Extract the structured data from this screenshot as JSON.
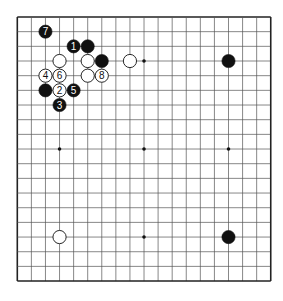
{
  "board": {
    "size": 19,
    "origin_x": 17.3,
    "origin_y": 17,
    "spacing_x": 14.08,
    "spacing_y": 14.67,
    "stone_radius": 6.6,
    "line_color": "#555555",
    "border_color": "#222222",
    "star_points": [
      [
        3,
        3
      ],
      [
        9,
        3
      ],
      [
        15,
        3
      ],
      [
        3,
        9
      ],
      [
        9,
        9
      ],
      [
        15,
        9
      ],
      [
        3,
        15
      ],
      [
        9,
        15
      ],
      [
        15,
        15
      ]
    ],
    "colors": {
      "black": "#111111",
      "white": "#ffffff",
      "black_label": "#ffffff",
      "white_label": "#111111"
    }
  },
  "stones": [
    {
      "color": "black",
      "col": 2,
      "row": 1,
      "label": "7"
    },
    {
      "color": "black",
      "col": 4,
      "row": 2,
      "label": "1"
    },
    {
      "color": "black",
      "col": 5,
      "row": 2,
      "label": ""
    },
    {
      "color": "white",
      "col": 3,
      "row": 3,
      "label": ""
    },
    {
      "color": "white",
      "col": 5,
      "row": 3,
      "label": ""
    },
    {
      "color": "black",
      "col": 6,
      "row": 3,
      "label": ""
    },
    {
      "color": "white",
      "col": 8,
      "row": 3,
      "label": ""
    },
    {
      "color": "black",
      "col": 15,
      "row": 3,
      "label": ""
    },
    {
      "color": "white",
      "col": 2,
      "row": 4,
      "label": "4"
    },
    {
      "color": "white",
      "col": 3,
      "row": 4,
      "label": "6"
    },
    {
      "color": "white",
      "col": 5,
      "row": 4,
      "label": ""
    },
    {
      "color": "white",
      "col": 6,
      "row": 4,
      "label": "8"
    },
    {
      "color": "black",
      "col": 2,
      "row": 5,
      "label": ""
    },
    {
      "color": "white",
      "col": 3,
      "row": 5,
      "label": "2"
    },
    {
      "color": "black",
      "col": 4,
      "row": 5,
      "label": "5"
    },
    {
      "color": "black",
      "col": 3,
      "row": 6,
      "label": "3"
    },
    {
      "color": "white",
      "col": 3,
      "row": 15,
      "label": ""
    },
    {
      "color": "black",
      "col": 15,
      "row": 15,
      "label": ""
    }
  ]
}
